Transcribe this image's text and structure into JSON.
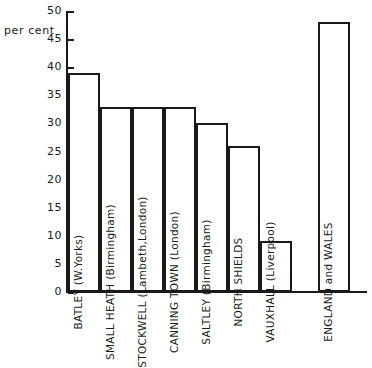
{
  "chart_data": {
    "type": "bar",
    "title": "",
    "xlabel": "",
    "ylabel": "per cent",
    "ylim": [
      0,
      50
    ],
    "ytick_step": 5,
    "yticks": [
      "50",
      "45",
      "40",
      "35",
      "30",
      "25",
      "20",
      "15",
      "10",
      "5",
      "0"
    ],
    "grid": false,
    "legend": false,
    "categories": [
      "BATLEY (W.Yorks)",
      "SMALL HEATH (Birmingham)",
      "STOCKWELL (Lambeth,London)",
      "CANNING TOWN (London)",
      "SALTLEY (Birmingham)",
      "NORTH SHIELDS",
      "VAUXHALL (Liverpool)",
      "ENGLAND and WALES"
    ],
    "values": [
      39,
      33,
      33,
      33,
      30,
      26,
      9,
      48
    ],
    "separated_last_bar": true,
    "bar_fill": "#ffffff",
    "bar_outline": "#1a1a1a"
  }
}
